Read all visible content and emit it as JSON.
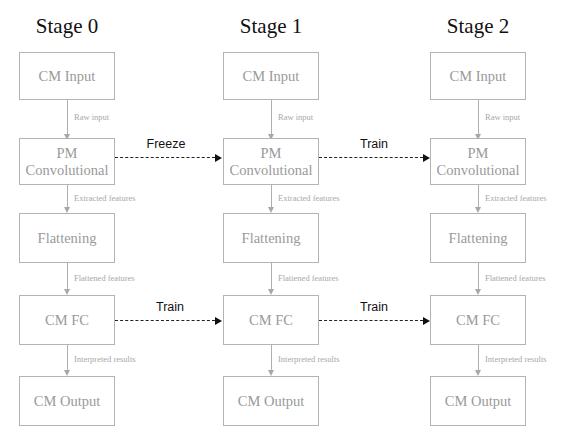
{
  "stages": [
    {
      "title": "Stage 0",
      "boxes": [
        "CM Input",
        "PM Convolutional",
        "Flattening",
        "CM FC",
        "CM Output"
      ],
      "flows": [
        "Raw input",
        "Extracted features",
        "Flattened features",
        "Interpreted results"
      ]
    },
    {
      "title": "Stage 1",
      "boxes": [
        "CM Input",
        "PM Convolutional",
        "Flattening",
        "CM FC",
        "CM Output"
      ],
      "flows": [
        "Raw input",
        "Extracted features",
        "Flattened features",
        "Interpreted results"
      ]
    },
    {
      "title": "Stage 2",
      "boxes": [
        "CM Input",
        "PM Convolutional",
        "Flattening",
        "CM FC",
        "CM Output"
      ],
      "flows": [
        "Raw input",
        "Extracted features",
        "Flattened features",
        "Interpreted results"
      ]
    }
  ],
  "transfers": [
    {
      "from_stage": 0,
      "to_stage": 1,
      "layer": "PM Convolutional",
      "label": "Freeze"
    },
    {
      "from_stage": 1,
      "to_stage": 2,
      "layer": "PM Convolutional",
      "label": "Train"
    },
    {
      "from_stage": 0,
      "to_stage": 1,
      "layer": "CM FC",
      "label": "Train"
    },
    {
      "from_stage": 1,
      "to_stage": 2,
      "layer": "CM FC",
      "label": "Train"
    }
  ]
}
